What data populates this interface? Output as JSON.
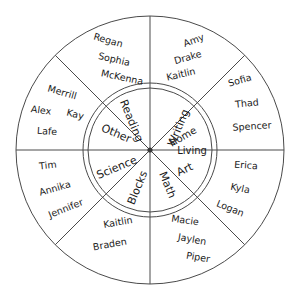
{
  "diagram": {
    "type": "two-ring-wheel",
    "center_x": 150,
    "center_y": 150,
    "outer_radius": 134,
    "inner_radius_outer": 67,
    "inner_radius_inner": 62,
    "sector_count": 8,
    "stroke_color": "#4a4a4a",
    "text_color": "#1a1a1a",
    "background_color": "#ffffff"
  },
  "sectors": [
    {
      "id": "writing",
      "center_label": "Writing",
      "center_label_lines": [
        "Writing"
      ],
      "angle_start_deg": -90,
      "angle_end_deg": -45,
      "names": [
        "Amy",
        "Drake",
        "Kaitlin"
      ]
    },
    {
      "id": "home-living",
      "center_label": "Home Living",
      "center_label_lines": [
        "Home",
        "Living"
      ],
      "angle_start_deg": -45,
      "angle_end_deg": 0,
      "names": [
        "Sofia",
        "Thad",
        "Spencer"
      ]
    },
    {
      "id": "art",
      "center_label": "Art",
      "center_label_lines": [
        "Art"
      ],
      "angle_start_deg": 0,
      "angle_end_deg": 45,
      "names": [
        "Erica",
        "Kyla",
        "Logan"
      ]
    },
    {
      "id": "math",
      "center_label": "Math",
      "center_label_lines": [
        "Math"
      ],
      "angle_start_deg": 45,
      "angle_end_deg": 90,
      "names": [
        "Macie",
        "Jaylen",
        "Piper"
      ]
    },
    {
      "id": "blocks",
      "center_label": "Blocks",
      "center_label_lines": [
        "Blocks"
      ],
      "angle_start_deg": 90,
      "angle_end_deg": 135,
      "names": [
        "Kaitlin",
        "Braden"
      ]
    },
    {
      "id": "science",
      "center_label": "Science",
      "center_label_lines": [
        "Science"
      ],
      "angle_start_deg": 135,
      "angle_end_deg": 180,
      "names": [
        "Tim",
        "Annika",
        "Jennifer"
      ]
    },
    {
      "id": "other",
      "center_label": "Other",
      "center_label_lines": [
        "Other"
      ],
      "angle_start_deg": 180,
      "angle_end_deg": 225,
      "names": [
        "Merrill",
        "Alex",
        "Kay",
        "Lafe"
      ]
    },
    {
      "id": "reading",
      "center_label": "Reading",
      "center_label_lines": [
        "Reading"
      ],
      "angle_start_deg": 225,
      "angle_end_deg": 270,
      "names": [
        "Regan",
        "Sophia",
        "McKenna"
      ]
    }
  ],
  "labels": {
    "writing_text": "Writing",
    "home_text": "Home",
    "living_text": "Living",
    "art_text": "Art",
    "math_text": "Math",
    "blocks_text": "Blocks",
    "science_text": "Science",
    "other_text": "Other",
    "reading_text": "Reading",
    "amy": "Amy",
    "drake": "Drake",
    "kaitlin_top": "Kaitlin",
    "sofia": "Sofia",
    "thad": "Thad",
    "spencer": "Spencer",
    "erica": "Erica",
    "kyla": "Kyla",
    "logan": "Logan",
    "macie": "Macie",
    "jaylen": "Jaylen",
    "piper": "Piper",
    "kaitlin_bottom": "Kaitlin",
    "braden": "Braden",
    "tim": "Tim",
    "annika": "Annika",
    "jennifer": "Jennifer",
    "merrill": "Merrill",
    "alex": "Alex",
    "kay": "Kay",
    "lafe": "Lafe",
    "regan": "Regan",
    "sophia": "Sophia",
    "mckenna": "McKenna"
  }
}
